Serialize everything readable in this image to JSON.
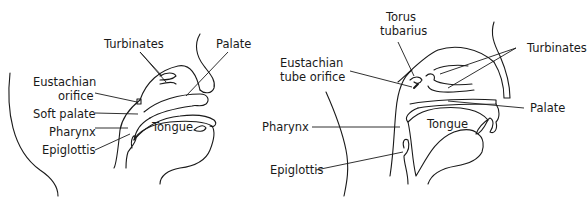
{
  "figure_left": {
    "title": "Infant upper airway",
    "labels": {
      "turbinates": "Turbinates",
      "palate": "Palate",
      "eustachian_line1": "Eustachian",
      "eustachian_line2": "orifice",
      "soft_palate": "Soft palate",
      "pharynx": "Pharynx",
      "epiglottis": "Epiglottis",
      "tongue": "Tongue"
    }
  },
  "figure_right": {
    "title": "Adult upper airway",
    "labels": {
      "torus_line1": "Torus",
      "torus_line2": "tubarius",
      "eustachian_line1": "Eustachian",
      "eustachian_line2": "tube orifice",
      "turbinates": "Turbinates",
      "palate": "Palate",
      "pharynx": "Pharynx",
      "tongue": "Tongue",
      "epiglottis": "Epiglottis"
    }
  },
  "colors": {
    "ink": "#1a1a1a",
    "background": "#ffffff"
  }
}
